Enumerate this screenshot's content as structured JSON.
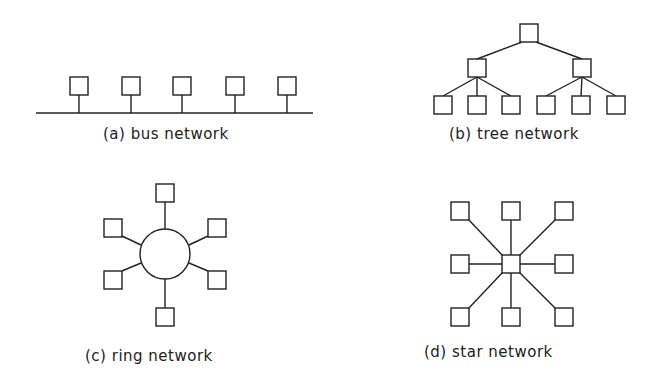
{
  "diagrams": {
    "bus": {
      "label": "(a) bus network",
      "node_count": 5
    },
    "tree": {
      "label": "(b) tree network",
      "levels": [
        1,
        2,
        6
      ]
    },
    "ring": {
      "label": "(c) ring network",
      "node_count": 6
    },
    "star": {
      "label": "(d) star network",
      "node_count": 8
    }
  },
  "colors": {
    "stroke": "#222222",
    "background": "#ffffff"
  }
}
